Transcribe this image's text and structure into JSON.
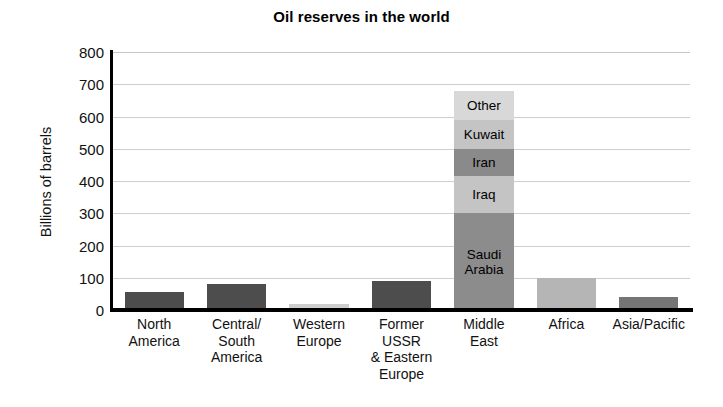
{
  "chart_data": {
    "type": "bar",
    "title": "Oil reserves in the world",
    "xlabel": "",
    "ylabel": "Billions of barrels",
    "ylim": [
      0,
      800
    ],
    "yticks": [
      800,
      700,
      600,
      500,
      400,
      300,
      200,
      100,
      0
    ],
    "grid": true,
    "legend": "none",
    "stacked": true,
    "categories": [
      "North\nAmerica",
      "Central/\nSouth\nAmerica",
      "Western\nEurope",
      "Former\nUSSR\n& Eastern\nEurope",
      "Middle\nEast",
      "Africa",
      "Asia/Pacific"
    ],
    "values": [
      55,
      80,
      20,
      90,
      680,
      100,
      40
    ],
    "bar_colors": [
      "#4d4d4d",
      "#4d4d4d",
      "#cfcfcf",
      "#4d4d4d",
      "#8c8c8c",
      "#b5b5b5",
      "#757575"
    ],
    "stack_segments": [
      {
        "label": "Saudi Arabia",
        "value": 300,
        "cumulative_top": 300,
        "color": "#8c8c8c"
      },
      {
        "label": "Iraq",
        "value": 115,
        "cumulative_top": 415,
        "color": "#c4c4c4"
      },
      {
        "label": "Iran",
        "value": 85,
        "cumulative_top": 500,
        "color": "#8a8a8a"
      },
      {
        "label": "Kuwait",
        "value": 90,
        "cumulative_top": 590,
        "color": "#c4c4c4"
      },
      {
        "label": "Other",
        "value": 90,
        "cumulative_top": 680,
        "color": "#d8d8d8"
      }
    ],
    "stacked_category": "Middle\nEast",
    "annotations": []
  },
  "colors": {
    "background": "#ffffff",
    "axis": "#000000",
    "gridline": "#cfcfcf",
    "text": "#111111"
  }
}
